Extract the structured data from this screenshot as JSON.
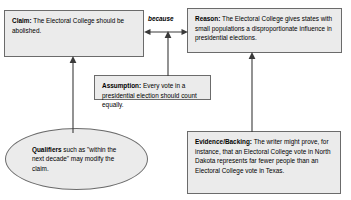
{
  "diagram": {
    "background_color": "#ffffff",
    "node_fill": "#ebebeb",
    "node_border": "#6b6b6b",
    "connector_color": "#3a3a3a"
  },
  "nodes": {
    "claim": {
      "label": "Claim",
      "label_suffix": ":",
      "text": " The Electoral College should be abolished.",
      "shape": "rectangle"
    },
    "reason": {
      "label": "Reason",
      "label_suffix": ":",
      "text": " The Electoral College gives states with small populations a disproportionate influence in presidential elections.",
      "shape": "rectangle"
    },
    "assumption": {
      "label": "Assumption",
      "label_suffix": ":",
      "text": " Every vote in a presidential election should count equally.",
      "shape": "rectangle"
    },
    "evidence": {
      "label": "Evidence/Backing",
      "label_suffix": ":",
      "text": " The writer might prove, for instance, that an Electoral College vote in North Dakota represents far fewer people than an Electoral College vote in Texas.",
      "shape": "rectangle"
    },
    "qualifiers": {
      "label": "Qualifiers",
      "label_suffix": "",
      "text": " such as \"within the next decade\" may modify the claim.",
      "shape": "ellipse"
    }
  },
  "connectors": {
    "claim_reason": {
      "label": "because",
      "type": "double-headed-horizontal-arrow",
      "from": "claim",
      "to": "reason"
    },
    "assumption_to_link": {
      "label": "",
      "type": "vertical-arrow-up",
      "from": "assumption",
      "to": "claim_reason"
    },
    "qualifiers_to_claim": {
      "label": "",
      "type": "vertical-arrow-up",
      "from": "qualifiers",
      "to": "claim"
    },
    "evidence_to_reason": {
      "label": "",
      "type": "vertical-arrow-up",
      "from": "evidence",
      "to": "reason"
    }
  }
}
